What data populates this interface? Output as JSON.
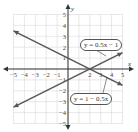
{
  "chart_data": {
    "type": "line",
    "title": "",
    "xlabel": "x",
    "ylabel": "y",
    "xlim": [
      -5,
      5
    ],
    "ylim": [
      -5,
      5
    ],
    "grid": true,
    "x_ticks": [
      -5,
      -4,
      -3,
      -2,
      -1,
      2,
      3,
      4,
      5
    ],
    "y_ticks": [
      5,
      4,
      3,
      2,
      1,
      -1,
      -2,
      -3,
      -4,
      -5
    ],
    "series": [
      {
        "name": "y = 0.5x − 1",
        "slope": 0.5,
        "intercept": -1,
        "x": [
          -5,
          5
        ],
        "y": [
          -3.5,
          1.5
        ],
        "color": "#555555"
      },
      {
        "name": "y = 1 − 0.5x",
        "slope": -0.5,
        "intercept": 1,
        "x": [
          -5,
          5
        ],
        "y": [
          3.5,
          -1.5
        ],
        "color": "#555555"
      }
    ],
    "annotations": [
      {
        "text": "y = 0.5x − 1",
        "position": "upper right"
      },
      {
        "text": "y = 1 − 0.5x",
        "position": "lower right"
      }
    ],
    "intersection": [
      2,
      0
    ]
  },
  "labels": {
    "line1": "y = 0.5x − 1",
    "line2": "y = 1 − 0.5x",
    "x_axis": "x",
    "y_axis": "y"
  },
  "colors": {
    "grid": "#d9d9d9",
    "axis": "#333333",
    "line": "#555555"
  }
}
